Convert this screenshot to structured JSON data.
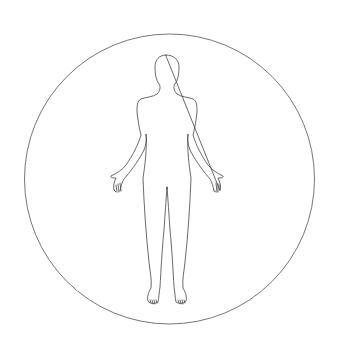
{
  "figure": {
    "background_color": "#ffffff",
    "stroke_color": "#555555",
    "circle": {
      "cx": 169.5,
      "cy": 179,
      "r": 145
    }
  }
}
